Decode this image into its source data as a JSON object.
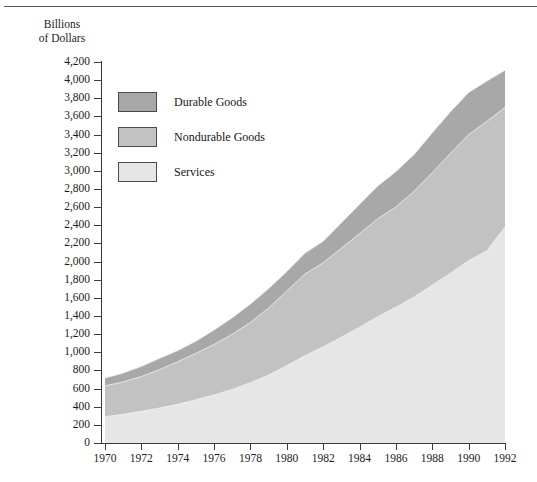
{
  "page": {
    "axis_title_lines": [
      "Billions",
      "of Dollars"
    ]
  },
  "legend": {
    "items": [
      {
        "label": "Durable Goods",
        "color": "#a8a8a8",
        "key": "durable"
      },
      {
        "label": "Nondurable Goods",
        "color": "#c2c2c2",
        "key": "nondurable"
      },
      {
        "label": "Services",
        "color": "#e6e6e6",
        "key": "services"
      }
    ]
  },
  "chart_data": {
    "type": "area",
    "stacked": true,
    "title": "",
    "subtitle": "",
    "xlabel": "",
    "ylabel": "Billions of Dollars",
    "xlim": [
      1970,
      1992
    ],
    "ylim": [
      0,
      4200
    ],
    "ytick_step": 200,
    "xtick_step": 2,
    "grid": false,
    "legend_position": "upper-left-inside",
    "x": [
      1970,
      1971,
      1972,
      1973,
      1974,
      1975,
      1976,
      1977,
      1978,
      1979,
      1980,
      1981,
      1982,
      1983,
      1984,
      1985,
      1986,
      1987,
      1988,
      1989,
      1990,
      1991,
      1992
    ],
    "xticks": [
      1970,
      1972,
      1974,
      1976,
      1978,
      1980,
      1982,
      1984,
      1986,
      1988,
      1990,
      1992
    ],
    "xtick_labels": [
      "1970",
      "1972",
      "1974",
      "1976",
      "1978",
      "1980",
      "1982",
      "1984",
      "1986",
      "1988",
      "1990",
      "1992"
    ],
    "yticks": [
      0,
      200,
      400,
      600,
      800,
      1000,
      1200,
      1400,
      1600,
      1800,
      2000,
      2200,
      2400,
      2600,
      2800,
      3000,
      3200,
      3400,
      3600,
      3800,
      4000,
      4200
    ],
    "ytick_labels": [
      "0",
      "200",
      "400",
      "600",
      "800",
      "1,000",
      "1,200",
      "1,400",
      "1,600",
      "1,800",
      "2,000",
      "2,200",
      "2,400",
      "2,600",
      "2,800",
      "3,000",
      "3,200",
      "3,400",
      "3,600",
      "3,800",
      "4,000",
      "4,200"
    ],
    "series": [
      {
        "name": "Services",
        "color": "#e6e6e6",
        "stack_order": 1,
        "values": [
          290,
          317,
          349,
          385,
          426,
          477,
          530,
          591,
          665,
          749,
          853,
          963,
          1060,
          1167,
          1277,
          1393,
          1497,
          1610,
          1740,
          1872,
          2010,
          2120,
          2380
        ]
      },
      {
        "name": "Nondurable Goods",
        "color": "#c2c2c2",
        "stack_order": 2,
        "values": [
          340,
          356,
          384,
          424,
          470,
          511,
          557,
          608,
          665,
          740,
          823,
          899,
          927,
          980,
          1030,
          1080,
          1105,
          1165,
          1240,
          1320,
          1390,
          1425,
          1320
        ]
      },
      {
        "name": "Durable Goods",
        "color": "#a8a8a8",
        "stack_order": 3,
        "values": [
          87,
          98,
          112,
          124,
          123,
          135,
          160,
          183,
          202,
          214,
          214,
          232,
          238,
          280,
          325,
          360,
          390,
          405,
          440,
          460,
          465,
          445,
          410
        ]
      }
    ],
    "totals": [
      717,
      771,
      845,
      933,
      1019,
      1123,
      1247,
      1382,
      1532,
      1703,
      1890,
      2094,
      2225,
      2427,
      2632,
      2833,
      2992,
      3180,
      3420,
      3652,
      3865,
      3990,
      4110
    ]
  }
}
